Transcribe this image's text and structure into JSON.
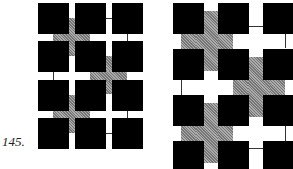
{
  "figure_label": "145.",
  "left_figure": {
    "grid": {
      "cols": 3,
      "rows": 4
    },
    "square_color": "#000000",
    "cross_color": "#8a8a8a",
    "crosses": [
      {
        "between_cols": [
          1,
          2
        ],
        "between_rows": [
          1,
          2
        ]
      },
      {
        "between_cols": [
          2,
          3
        ],
        "between_rows": [
          2,
          3
        ]
      },
      {
        "between_cols": [
          1,
          2
        ],
        "between_rows": [
          3,
          4
        ]
      }
    ]
  },
  "right_figure": {
    "grid": {
      "cols": 3,
      "rows": 4
    },
    "square_color": "#000000",
    "cross_color": "#8a8a8a",
    "crosses": [
      {
        "between_cols": [
          1,
          2
        ],
        "between_rows": [
          1,
          2
        ]
      },
      {
        "between_cols": [
          2,
          3
        ],
        "between_rows": [
          2,
          3
        ]
      },
      {
        "between_cols": [
          1,
          2
        ],
        "between_rows": [
          3,
          4
        ]
      }
    ]
  }
}
